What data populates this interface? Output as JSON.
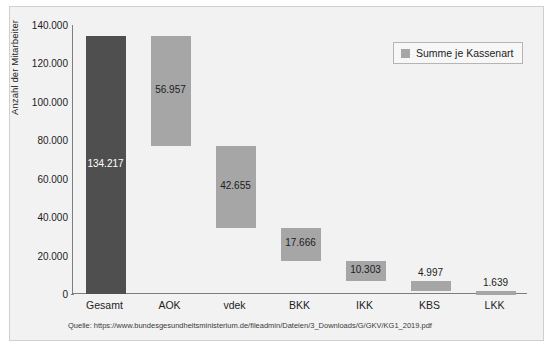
{
  "chart_data": {
    "type": "bar",
    "subtype": "waterfall",
    "title": "",
    "xlabel": "",
    "ylabel": "Anzahl der Mitarbeiter",
    "ylim": [
      0,
      140000
    ],
    "ytick_values": [
      0,
      20000,
      40000,
      60000,
      80000,
      100000,
      120000,
      140000
    ],
    "ytick_labels": [
      "0",
      "20.000",
      "40.000",
      "60.000",
      "80.000",
      "100.000",
      "120.000",
      "140.000"
    ],
    "grid": false,
    "legend_position": "top-right",
    "legend": [
      {
        "label": "Summe je Kassenart",
        "color": "#a6a6a6"
      }
    ],
    "categories": [
      "Gesamt",
      "AOK",
      "vdek",
      "BKK",
      "IKK",
      "KBS",
      "LKK"
    ],
    "values": [
      134217,
      56957,
      42655,
      17666,
      10303,
      4997,
      1639
    ],
    "value_labels": [
      "134.217",
      "56.957",
      "42.655",
      "17.666",
      "10.303",
      "4.997",
      "1.639"
    ],
    "bars": [
      {
        "category": "Gesamt",
        "value": 134217,
        "label": "134.217",
        "base": 0,
        "top": 134217,
        "color": "#4f4f4f",
        "label_position": "inside",
        "label_color": "#ffffff"
      },
      {
        "category": "AOK",
        "value": 56957,
        "label": "56.957",
        "base": 77260,
        "top": 134217,
        "color": "#a6a6a6",
        "label_position": "inside",
        "label_color": "#1d1d1d"
      },
      {
        "category": "vdek",
        "value": 42655,
        "label": "42.655",
        "base": 34605,
        "top": 77260,
        "color": "#a6a6a6",
        "label_position": "inside",
        "label_color": "#1d1d1d"
      },
      {
        "category": "BKK",
        "value": 17666,
        "label": "17.666",
        "base": 16939,
        "top": 34605,
        "color": "#a6a6a6",
        "label_position": "inside",
        "label_color": "#1d1d1d"
      },
      {
        "category": "IKK",
        "value": 10303,
        "label": "10.303",
        "base": 6636,
        "top": 16939,
        "color": "#a6a6a6",
        "label_position": "inside",
        "label_color": "#1d1d1d"
      },
      {
        "category": "KBS",
        "value": 4997,
        "label": "4.997",
        "base": 1639,
        "top": 6636,
        "color": "#a6a6a6",
        "label_position": "above",
        "label_color": "#1d1d1d"
      },
      {
        "category": "LKK",
        "value": 1639,
        "label": "1.639",
        "base": 0,
        "top": 1639,
        "color": "#a6a6a6",
        "label_position": "above",
        "label_color": "#1d1d1d"
      }
    ]
  },
  "source": {
    "text": "Quelle: https://www.bundesgesundheitsministerium.de/fileadmin/Dateien/3_Downloads/G/GKV/KG1_2019.pdf"
  },
  "colors": {
    "total_bar": "#4f4f4f",
    "step_bar": "#a6a6a6",
    "axis": "#7d7d7d",
    "background": "#f2f2f2",
    "frame": "#cfcfcf",
    "text": "#1d1d1d"
  }
}
